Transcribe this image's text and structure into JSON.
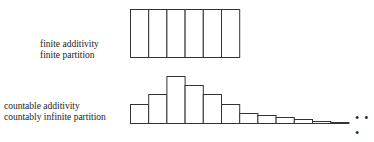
{
  "diagram": {
    "top": {
      "label_lines": [
        "finite additivity",
        "finite partition"
      ],
      "cells": 6
    },
    "bottom": {
      "label_lines": [
        "countable additivity",
        "countably infinite partition"
      ],
      "bar_heights": [
        19,
        29,
        47,
        38,
        29,
        19,
        10,
        8,
        6,
        4,
        2,
        1
      ],
      "ellipsis": "• • •"
    },
    "stroke_color": "#333333"
  }
}
